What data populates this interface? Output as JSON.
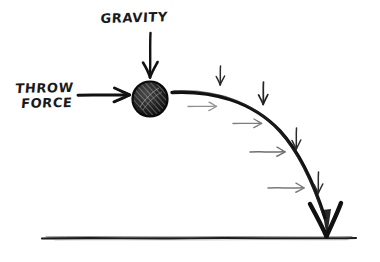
{
  "diagram": {
    "background_color": "#ffffff",
    "ink_color": "#111111",
    "faint_ink_color": "#8a8a8a",
    "labels": {
      "gravity": "GRAVITY",
      "throw_line1": "THROW",
      "throw_line2": "FORCE"
    },
    "elements": {
      "ball": {
        "name": "thrown ball",
        "center_x": 150,
        "center_y": 99,
        "radius": 18,
        "fill": "#1c1c1c",
        "shading": "diagonal hatching"
      },
      "ground": {
        "name": "ground line",
        "x_start": 42,
        "x_end": 356,
        "y": 238
      },
      "gravity_arrow": {
        "name": "gravity force arrow",
        "direction": "down",
        "x": 150,
        "y_start": 33,
        "y_end": 78
      },
      "throw_arrow": {
        "name": "throw force arrow",
        "direction": "right",
        "y": 95,
        "x_start": 78,
        "x_end": 130
      },
      "trajectory": {
        "name": "projectile trajectory curve",
        "start_x": 172,
        "start_y": 92,
        "end_x": 327,
        "end_y": 236,
        "arrowhead": "large solid V at ground impact"
      },
      "velocity_arrows": {
        "name": "horizontal velocity component arrows",
        "count": 4,
        "color": "#8a8a8a",
        "direction": "right"
      },
      "gravity_component_arrows": {
        "name": "vertical gravity component arrows",
        "count": 4,
        "color": "#333333",
        "direction": "down"
      }
    }
  }
}
